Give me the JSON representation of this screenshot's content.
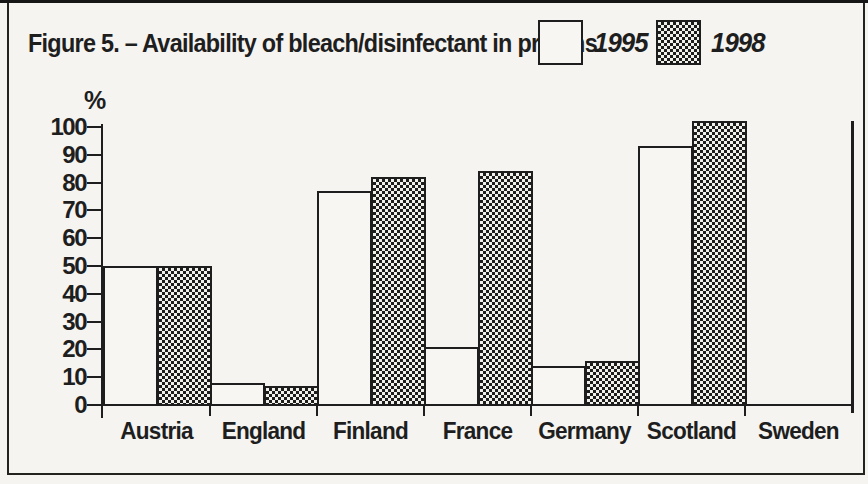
{
  "figure": {
    "title": "Figure 5. – Availability of bleach/disinfectant in prisons.",
    "y_axis_unit_label": "%"
  },
  "legend": {
    "items": [
      {
        "label": "1995",
        "swatch": "white"
      },
      {
        "label": "1998",
        "swatch": "checkerboard"
      }
    ]
  },
  "colors": {
    "ink": "#1e1e1e",
    "paper": "#f5f4f1",
    "bar_white_fill": "#f7f6f2"
  },
  "chart_data": {
    "type": "bar",
    "title": "Figure 5. – Availability of bleach/disinfectant in prisons.",
    "xlabel": "",
    "ylabel": "%",
    "ylim": [
      0,
      100
    ],
    "ytick_step": 10,
    "grid": false,
    "legend_position": "top-right",
    "categories": [
      "Austria",
      "England",
      "Finland",
      "France",
      "Germany",
      "Scotland",
      "Sweden"
    ],
    "series": [
      {
        "name": "1995",
        "pattern": "plain-white",
        "values": [
          50,
          8,
          77,
          21,
          14,
          93,
          0
        ]
      },
      {
        "name": "1998",
        "pattern": "checkerboard",
        "values": [
          50,
          7,
          82,
          84,
          16,
          102,
          0
        ]
      }
    ],
    "axis_end_line_pct": 102,
    "annotations": [
      "Thin vertical line at the right end of the x-axis (Sweden boundary) rising to ~102%",
      "Scotland 1998 bar is drawn slightly above the 100% tick"
    ]
  }
}
